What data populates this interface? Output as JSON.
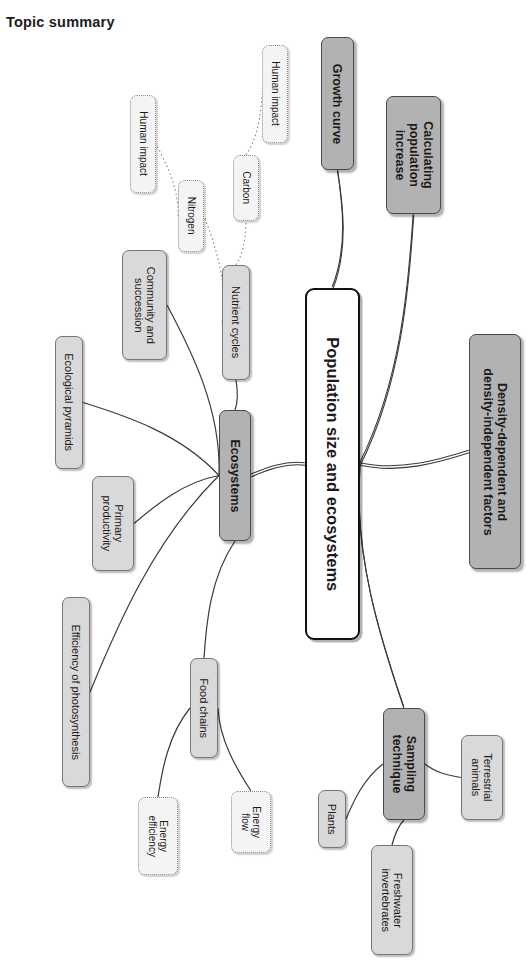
{
  "page": {
    "title": "Topic summary",
    "diagram_type": "mind-map",
    "colors": {
      "root_fill": "#ffffff",
      "root_border": "#111111",
      "main_fill": "#b2b2b2",
      "main_border": "#4a4a4a",
      "sub_fill": "#d9d9d9",
      "sub_border": "#777777",
      "leaf_fill": "#f4f4f4",
      "leaf_border": "#8a8a8a",
      "connector": "#3a3a3a",
      "text": "#1a1a1a"
    }
  },
  "nodes": [
    {
      "id": "root",
      "label": "Population size and ecosystems",
      "level": "root",
      "x": 305,
      "y": 288,
      "w": 55,
      "h": 352
    },
    {
      "id": "growth",
      "label": "Growth curve",
      "level": "main",
      "x": 321,
      "y": 37,
      "w": 33,
      "h": 133
    },
    {
      "id": "calc",
      "label": "Calculating\npopulation\nincrease",
      "level": "main",
      "x": 386,
      "y": 96,
      "w": 55,
      "h": 118
    },
    {
      "id": "density",
      "label": "Density-dependent and\ndensity-independent factors",
      "level": "main",
      "x": 469,
      "y": 334,
      "w": 52,
      "h": 235
    },
    {
      "id": "ecosystems",
      "label": "Ecosystems",
      "level": "main",
      "x": 219,
      "y": 410,
      "w": 32,
      "h": 131
    },
    {
      "id": "sampling",
      "label": "Sampling\ntechnique",
      "level": "main",
      "x": 383,
      "y": 708,
      "w": 42,
      "h": 112
    },
    {
      "id": "nutrient",
      "label": "Nutrient cycles",
      "level": "sub",
      "x": 222,
      "y": 265,
      "w": 28,
      "h": 115
    },
    {
      "id": "community",
      "label": "Community and\nsuccession",
      "level": "sub",
      "x": 122,
      "y": 250,
      "w": 45,
      "h": 110
    },
    {
      "id": "ecopyramids",
      "label": "Ecological pyramids",
      "level": "sub",
      "x": 55,
      "y": 336,
      "w": 28,
      "h": 133
    },
    {
      "id": "primprod",
      "label": "Primary\nproductivity",
      "level": "sub",
      "x": 92,
      "y": 476,
      "w": 42,
      "h": 95
    },
    {
      "id": "effphoto",
      "label": "Efficiency of photosynthesis",
      "level": "sub",
      "x": 62,
      "y": 597,
      "w": 28,
      "h": 190
    },
    {
      "id": "foodchains",
      "label": "Food chains",
      "level": "sub",
      "x": 190,
      "y": 658,
      "w": 28,
      "h": 100
    },
    {
      "id": "plants",
      "label": "Plants",
      "level": "sub",
      "x": 318,
      "y": 790,
      "w": 28,
      "h": 58
    },
    {
      "id": "terrestrial",
      "label": "Terrestrial\nanimals",
      "level": "sub",
      "x": 461,
      "y": 735,
      "w": 42,
      "h": 85
    },
    {
      "id": "freshwater",
      "label": "Freshwater\ninvertebrates",
      "level": "sub",
      "x": 371,
      "y": 845,
      "w": 42,
      "h": 110
    },
    {
      "id": "carbon",
      "label": "Carbon",
      "level": "leaf",
      "x": 233,
      "y": 155,
      "w": 26,
      "h": 66
    },
    {
      "id": "nitrogen",
      "label": "Nitrogen",
      "level": "leaf",
      "x": 178,
      "y": 180,
      "w": 26,
      "h": 72
    },
    {
      "id": "human1",
      "label": "Human impact",
      "level": "leaf",
      "x": 130,
      "y": 95,
      "w": 26,
      "h": 98
    },
    {
      "id": "human2",
      "label": "Human impact",
      "level": "leaf",
      "x": 262,
      "y": 45,
      "w": 26,
      "h": 98
    },
    {
      "id": "energyeff",
      "label": "Energy\nefficiency",
      "level": "leaf",
      "x": 138,
      "y": 797,
      "w": 40,
      "h": 78
    },
    {
      "id": "energyflow",
      "label": "Energy\nflow",
      "level": "leaf",
      "x": 231,
      "y": 791,
      "w": 40,
      "h": 62
    }
  ],
  "connections": [
    {
      "from": "root",
      "to": "growth",
      "style": "tapered"
    },
    {
      "from": "root",
      "to": "calc",
      "style": "tapered"
    },
    {
      "from": "root",
      "to": "density",
      "style": "tapered"
    },
    {
      "from": "root",
      "to": "ecosystems",
      "style": "tapered"
    },
    {
      "from": "root",
      "to": "sampling",
      "style": "tapered"
    },
    {
      "from": "ecosystems",
      "to": "nutrient",
      "style": "thin"
    },
    {
      "from": "ecosystems",
      "to": "community",
      "style": "thin"
    },
    {
      "from": "ecosystems",
      "to": "ecopyramids",
      "style": "thin"
    },
    {
      "from": "ecosystems",
      "to": "primprod",
      "style": "thin"
    },
    {
      "from": "ecosystems",
      "to": "effphoto",
      "style": "thin"
    },
    {
      "from": "ecosystems",
      "to": "foodchains",
      "style": "thin"
    },
    {
      "from": "nutrient",
      "to": "carbon",
      "style": "dotted"
    },
    {
      "from": "nutrient",
      "to": "nitrogen",
      "style": "dotted"
    },
    {
      "from": "nitrogen",
      "to": "human1",
      "style": "dotted"
    },
    {
      "from": "carbon",
      "to": "human2",
      "style": "dotted"
    },
    {
      "from": "foodchains",
      "to": "energyeff",
      "style": "thin"
    },
    {
      "from": "foodchains",
      "to": "energyflow",
      "style": "thin"
    },
    {
      "from": "sampling",
      "to": "plants",
      "style": "thin"
    },
    {
      "from": "sampling",
      "to": "terrestrial",
      "style": "thin"
    },
    {
      "from": "sampling",
      "to": "freshwater",
      "style": "thin"
    }
  ]
}
